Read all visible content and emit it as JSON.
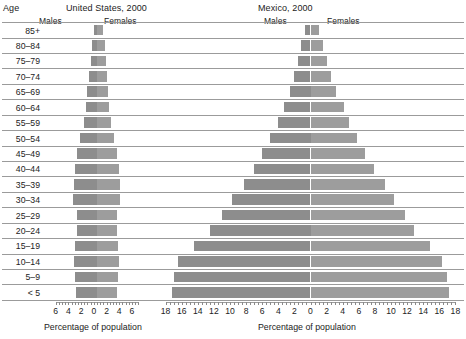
{
  "titles": {
    "age": "Age",
    "us": "United States, 2000",
    "mexico": "Mexico, 2000"
  },
  "legend": {
    "males": "Males",
    "females": "Females",
    "male_color": "#8d8d8d",
    "female_color": "#9d9d9d"
  },
  "axis_caption": "Percentage of population",
  "age_groups": [
    "85+",
    "80–84",
    "75–79",
    "70–74",
    "65–69",
    "60–64",
    "55–59",
    "50–54",
    "45–49",
    "40–44",
    "35–39",
    "30–34",
    "25–29",
    "20–24",
    "15–19",
    "10–14",
    "5–9",
    "< 5"
  ],
  "us_ticks": [
    "6",
    "4",
    "2",
    "0",
    "2",
    "4",
    "6"
  ],
  "mx_ticks": [
    "18",
    "16",
    "14",
    "12",
    "10",
    "8",
    "6",
    "4",
    "2",
    "0",
    "2",
    "4",
    "6",
    "8",
    "10",
    "12",
    "14",
    "16",
    "18"
  ],
  "chart_data": [
    {
      "type": "bar",
      "title": "United States, 2000",
      "xlabel": "Percentage of population",
      "ylabel": "Age",
      "xlim": [
        -7,
        7
      ],
      "xticks": [
        -6,
        -4,
        -2,
        0,
        2,
        4,
        6
      ],
      "grid": true,
      "legend": [
        "Males",
        "Females"
      ],
      "legend_position": "top",
      "categories": [
        "85+",
        "80–84",
        "75–79",
        "70–74",
        "65–69",
        "60–64",
        "55–59",
        "50–54",
        "45–49",
        "40–44",
        "35–39",
        "30–34",
        "25–29",
        "20–24",
        "15–19",
        "10–14",
        "5–9",
        "< 5"
      ],
      "series": [
        {
          "name": "Males",
          "values": [
            0.5,
            0.8,
            1.0,
            1.3,
            1.6,
            1.8,
            2.1,
            2.6,
            3.1,
            3.4,
            3.6,
            3.8,
            3.2,
            3.1,
            3.4,
            3.6,
            3.4,
            3.3
          ]
        },
        {
          "name": "Females",
          "values": [
            1.0,
            1.2,
            1.4,
            1.6,
            1.8,
            1.9,
            2.2,
            2.7,
            3.2,
            3.5,
            3.6,
            3.7,
            3.2,
            3.1,
            3.3,
            3.4,
            3.3,
            3.2
          ]
        }
      ]
    },
    {
      "type": "bar",
      "title": "Mexico, 2000",
      "xlabel": "Percentage of population",
      "ylabel": "Age",
      "xlim": [
        -18.5,
        18.5
      ],
      "xticks": [
        -18,
        -16,
        -14,
        -12,
        -10,
        -8,
        -6,
        -4,
        -2,
        0,
        2,
        4,
        6,
        8,
        10,
        12,
        14,
        16,
        18
      ],
      "grid": true,
      "legend": [
        "Males",
        "Females"
      ],
      "legend_position": "top",
      "categories": [
        "85+",
        "80–84",
        "75–79",
        "70–74",
        "65–69",
        "60–64",
        "55–59",
        "50–54",
        "45–49",
        "40–44",
        "35–39",
        "30–34",
        "25–29",
        "20–24",
        "15–19",
        "10–14",
        "5–9",
        "< 5"
      ],
      "series": [
        {
          "name": "Males",
          "values": [
            0.7,
            1.2,
            1.6,
            2.0,
            2.5,
            3.3,
            4.0,
            5.0,
            6.0,
            7.0,
            8.3,
            9.7,
            11.0,
            12.5,
            14.5,
            16.5,
            17.0,
            17.2
          ]
        },
        {
          "name": "Females",
          "values": [
            1.0,
            1.6,
            2.0,
            2.6,
            3.2,
            4.1,
            4.8,
            5.8,
            6.8,
            7.9,
            9.2,
            10.4,
            11.7,
            12.8,
            14.8,
            16.3,
            17.0,
            17.2
          ]
        }
      ]
    }
  ]
}
